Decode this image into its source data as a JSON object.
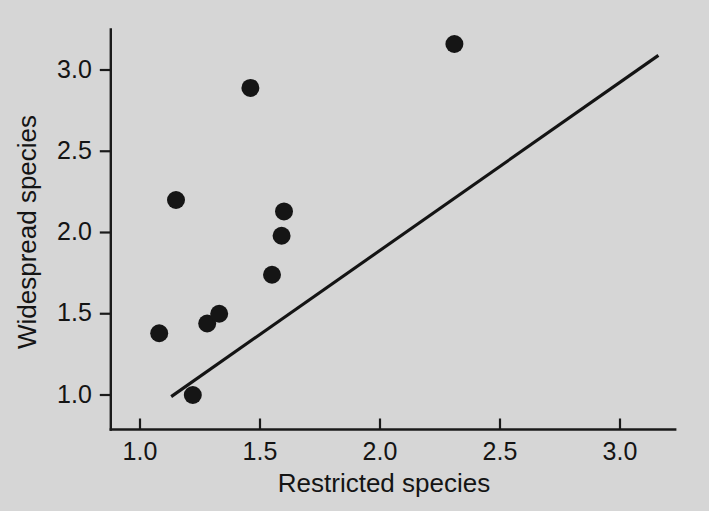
{
  "chart_data": {
    "type": "scatter",
    "title": "",
    "subtitle": "",
    "xlabel": "Restricted species",
    "ylabel": "Widespread species",
    "xlim": [
      0.87,
      3.23
    ],
    "ylim": [
      0.8,
      3.25
    ],
    "xticks": [
      1.0,
      1.5,
      2.0,
      2.5,
      3.0
    ],
    "xtick_labels": [
      "1.0",
      "1.5",
      "2.0",
      "2.5",
      "3.0"
    ],
    "yticks": [
      1.0,
      1.5,
      2.0,
      2.5,
      3.0
    ],
    "ytick_labels": [
      "1.0",
      "1.5",
      "2.0",
      "2.5",
      "3.0"
    ],
    "grid": false,
    "legend": false,
    "marker": "filled-circle",
    "marker_color": "#151515",
    "marker_size": 9,
    "points": [
      {
        "x": 1.08,
        "y": 1.38
      },
      {
        "x": 1.15,
        "y": 2.2
      },
      {
        "x": 1.22,
        "y": 1.0
      },
      {
        "x": 1.28,
        "y": 1.44
      },
      {
        "x": 1.33,
        "y": 1.5
      },
      {
        "x": 1.46,
        "y": 2.89
      },
      {
        "x": 1.55,
        "y": 1.74
      },
      {
        "x": 1.59,
        "y": 1.98
      },
      {
        "x": 1.6,
        "y": 2.13
      },
      {
        "x": 2.31,
        "y": 3.16
      }
    ],
    "line": {
      "name": "fitted-line",
      "color": "#141414",
      "x_start": 1.13,
      "y_start": 0.99,
      "x_end": 3.16,
      "y_end": 3.09
    }
  },
  "axis_titles": {
    "x": "Restricted species",
    "y": "Widespread species"
  },
  "colors": {
    "background": "#d6d6d6",
    "ink": "#141414"
  }
}
